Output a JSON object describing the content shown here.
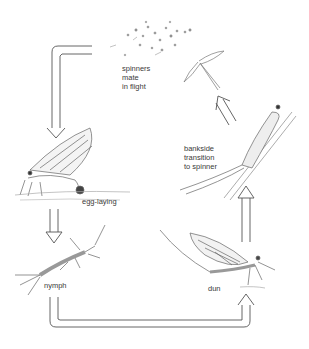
{
  "diagram": {
    "stages": [
      {
        "id": "spinners",
        "label": "spinners\nmate\nin flight"
      },
      {
        "id": "egg-laying",
        "label": "egg-laying"
      },
      {
        "id": "nymph",
        "label": "nymph"
      },
      {
        "id": "dun",
        "label": "dun"
      },
      {
        "id": "bankside",
        "label": "bankside\ntransition\nto spinner"
      }
    ],
    "flow": [
      {
        "from": "spinners",
        "to": "egg-laying",
        "direction": "down"
      },
      {
        "from": "egg-laying",
        "to": "nymph",
        "direction": "down"
      },
      {
        "from": "nymph",
        "to": "dun",
        "direction": "right-up"
      },
      {
        "from": "dun",
        "to": "bankside",
        "direction": "up"
      },
      {
        "from": "bankside",
        "to": "spinners",
        "direction": "up-left"
      }
    ],
    "colors": {
      "line": "#555555",
      "sketch": "#777777",
      "background": "#ffffff"
    }
  }
}
